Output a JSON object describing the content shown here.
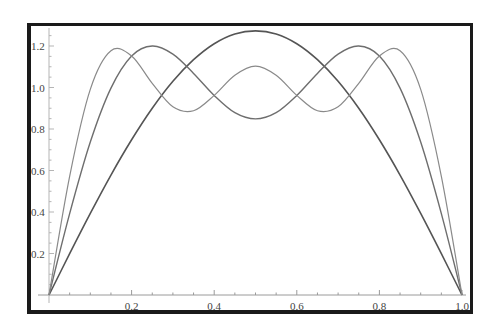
{
  "chart_data": {
    "type": "line",
    "title": "",
    "xlabel": "",
    "ylabel": "",
    "xlim": [
      0,
      1.0
    ],
    "ylim": [
      0,
      1.3
    ],
    "grid": false,
    "legend": null,
    "x_ticks": [
      0.2,
      0.4,
      0.6,
      0.8,
      1.0
    ],
    "x_tick_labels": [
      "0.2",
      "0.4",
      "0.6",
      "0.8",
      "1.0"
    ],
    "y_ticks": [
      0.2,
      0.4,
      0.6,
      0.8,
      1.0,
      1.2
    ],
    "y_tick_labels": [
      "0.2",
      "0.4",
      "0.6",
      "0.8",
      "1.0",
      "1.2"
    ],
    "x": [
      0,
      0.05,
      0.1,
      0.15,
      0.2,
      0.25,
      0.3,
      0.35,
      0.4,
      0.45,
      0.5,
      0.55,
      0.6,
      0.65,
      0.7,
      0.75,
      0.8,
      0.85,
      0.9,
      0.95,
      1.0
    ],
    "series": [
      {
        "name": "1 term",
        "color": "#555555",
        "width": 1.6,
        "values": [
          0,
          0.199,
          0.393,
          0.578,
          0.748,
          0.9,
          1.03,
          1.134,
          1.211,
          1.258,
          1.273,
          1.258,
          1.211,
          1.134,
          1.03,
          0.9,
          0.748,
          0.578,
          0.393,
          0.199,
          0
        ]
      },
      {
        "name": "2 terms",
        "color": "#6e6e6e",
        "width": 1.4,
        "values": [
          0,
          0.392,
          0.737,
          0.997,
          1.152,
          1.2,
          1.161,
          1.068,
          0.962,
          0.879,
          0.849,
          0.879,
          0.962,
          1.068,
          1.161,
          1.2,
          1.152,
          0.997,
          0.737,
          0.392,
          0
        ]
      },
      {
        "name": "3 terms",
        "color": "#8a8a8a",
        "width": 1.2,
        "values": [
          0,
          0.572,
          0.991,
          1.177,
          1.152,
          1.02,
          0.907,
          0.888,
          0.962,
          1.059,
          1.103,
          1.059,
          0.962,
          0.888,
          0.907,
          1.02,
          1.152,
          1.177,
          0.991,
          0.572,
          0
        ]
      }
    ]
  }
}
